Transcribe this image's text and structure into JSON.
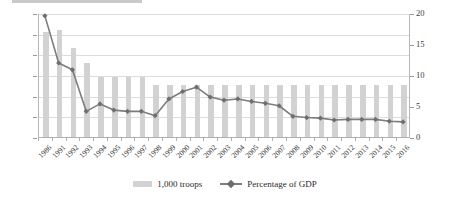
{
  "chart_data": {
    "type": "bar",
    "title": "",
    "subtitle": "",
    "xlabel": "",
    "ylabel": "",
    "grid": true,
    "legend_position": "bottom-center",
    "categories": [
      "1986",
      "1991",
      "1992",
      "1993",
      "1994",
      "1995",
      "1996",
      "1997",
      "1998",
      "1999",
      "2000",
      "2001",
      "2002",
      "2003",
      "2004",
      "2005",
      "2006",
      "2007",
      "2008",
      "2009",
      "2010",
      "2011",
      "2012",
      "2013",
      "2014",
      "2015",
      "2016"
    ],
    "axes": {
      "left": {
        "label": "1,000 troops",
        "min": 0,
        "max": 1200,
        "step": 200,
        "ticks": [
          "0",
          "200",
          "400",
          "600",
          "800",
          "1000",
          "1200"
        ]
      },
      "right": {
        "label": "Percentage of GDP",
        "min": 0,
        "max": 20,
        "step": 5,
        "ticks": [
          "0",
          "5",
          "10",
          "15",
          "20"
        ]
      }
    },
    "series": [
      {
        "name": "1,000 troops",
        "axis": "left",
        "type": "bar",
        "color": "#d2d2d2",
        "values": [
          1020,
          1040,
          860,
          720,
          580,
          580,
          580,
          580,
          500,
          500,
          500,
          500,
          500,
          500,
          500,
          500,
          500,
          500,
          500,
          500,
          500,
          500,
          500,
          500,
          500,
          500,
          500
        ]
      },
      {
        "name": "Percentage of GDP",
        "axis": "right",
        "type": "line",
        "color": "#7d7d7d",
        "values": [
          19.7,
          12.1,
          11.0,
          4.3,
          5.5,
          4.5,
          4.3,
          4.3,
          3.6,
          6.3,
          7.5,
          8.2,
          6.6,
          6.1,
          6.3,
          5.9,
          5.6,
          5.2,
          3.5,
          3.3,
          3.2,
          2.9,
          3.0,
          3.0,
          3.0,
          2.7,
          2.6
        ]
      }
    ]
  },
  "legend": {
    "entries": [
      {
        "label": "1,000 troops",
        "marker": "bar-swatch"
      },
      {
        "label": "Percentage of GDP",
        "marker": "line-marker-swatch"
      }
    ]
  }
}
